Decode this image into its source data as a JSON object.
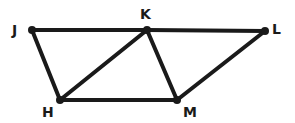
{
  "diagram": {
    "type": "geometry",
    "stroke_color": "#1a1a1a",
    "background": "#ffffff",
    "points": [
      {
        "id": "J",
        "label": "J",
        "x": 32,
        "y": 30,
        "lx": 12,
        "ly": 35
      },
      {
        "id": "K",
        "label": "K",
        "x": 147,
        "y": 30,
        "lx": 140,
        "ly": 19
      },
      {
        "id": "L",
        "label": "L",
        "x": 265,
        "y": 31,
        "lx": 272,
        "ly": 34
      },
      {
        "id": "H",
        "label": "H",
        "x": 60,
        "y": 100,
        "lx": 42,
        "ly": 117
      },
      {
        "id": "M",
        "label": "M",
        "x": 177,
        "y": 100,
        "lx": 183,
        "ly": 117
      }
    ],
    "segments": [
      [
        "J",
        "K"
      ],
      [
        "K",
        "L"
      ],
      [
        "J",
        "H"
      ],
      [
        "H",
        "K"
      ],
      [
        "K",
        "M"
      ],
      [
        "H",
        "M"
      ],
      [
        "M",
        "L"
      ]
    ]
  }
}
